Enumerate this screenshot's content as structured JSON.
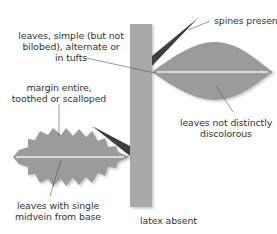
{
  "labels": {
    "spines": "spines present",
    "leaves_simple": [
      "leaves, simple (but not",
      "bilobed), alternate or",
      "in tufts"
    ],
    "margin": [
      "margin entire,",
      "toothed or scalloped"
    ],
    "discolorous": [
      "leaves not distinctly",
      "discolorous"
    ],
    "midvein": [
      "leaves with single",
      "midvein from base"
    ],
    "latex": "latex absent"
  },
  "colors": {
    "stem": "#a9a9a9",
    "leaf": "#9b9b9b",
    "spine": "#3f3f3f",
    "midvein": "#d8d8d8",
    "leader": "#555555",
    "text": "#333333"
  }
}
